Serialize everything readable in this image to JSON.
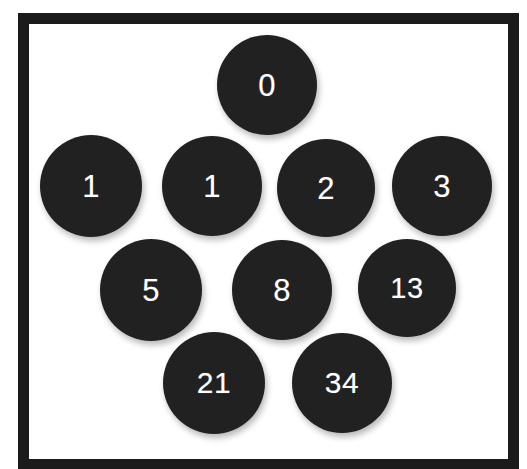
{
  "diagram": {
    "background_color": "#ffffff",
    "frame": {
      "border_color": "#1b1b1b",
      "border_width_px": 11,
      "fill_color": "#ffffff"
    },
    "circle_style": {
      "fill_color": "#212121",
      "text_color": "#ffffff"
    },
    "rows": [
      {
        "row_index": 0,
        "circles": [
          {
            "label": "0",
            "cx": 267,
            "cy": 85,
            "r": 50,
            "font_size": 31
          }
        ]
      },
      {
        "row_index": 1,
        "circles": [
          {
            "label": "1",
            "cx": 91,
            "cy": 186,
            "r": 51,
            "font_size": 31
          },
          {
            "label": "1",
            "cx": 212,
            "cy": 186,
            "r": 50,
            "font_size": 31
          },
          {
            "label": "2",
            "cx": 326,
            "cy": 188,
            "r": 49,
            "font_size": 31
          },
          {
            "label": "3",
            "cx": 442,
            "cy": 186,
            "r": 50,
            "font_size": 31
          }
        ]
      },
      {
        "row_index": 2,
        "circles": [
          {
            "label": "5",
            "cx": 151,
            "cy": 290,
            "r": 51,
            "font_size": 31
          },
          {
            "label": "8",
            "cx": 282,
            "cy": 290,
            "r": 50,
            "font_size": 31
          },
          {
            "label": "13",
            "cx": 407,
            "cy": 288,
            "r": 49,
            "font_size": 29
          }
        ]
      },
      {
        "row_index": 3,
        "circles": [
          {
            "label": "21",
            "cx": 214,
            "cy": 383,
            "r": 51,
            "font_size": 30
          },
          {
            "label": "34",
            "cx": 342,
            "cy": 383,
            "r": 50,
            "font_size": 30
          }
        ]
      }
    ],
    "sequence": [
      "0",
      "1",
      "1",
      "2",
      "3",
      "5",
      "8",
      "13",
      "21",
      "34"
    ]
  }
}
